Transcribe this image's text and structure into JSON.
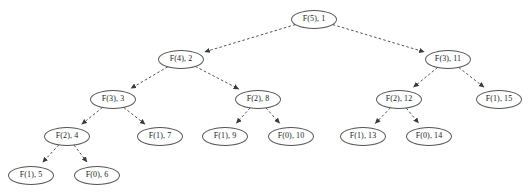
{
  "diagram": {
    "kind": "tree",
    "width": 529,
    "height": 195,
    "background_color": "#ffffff",
    "node_stroke_color": "#555555",
    "node_fill_color": "#ffffff",
    "edge_color": "#555555",
    "edge_style": "dashed",
    "arrowhead": "filled-triangle",
    "text_color": "#1a1a1a",
    "node_width": 46,
    "node_height": 19,
    "nodes": [
      {
        "id": "n1",
        "label": "F(5), 1",
        "cx": 314,
        "cy": 19,
        "level": 0,
        "call": "F(5)",
        "order": 1
      },
      {
        "id": "n2",
        "label": "F(4), 2",
        "cx": 181,
        "cy": 59,
        "level": 1,
        "call": "F(4)",
        "order": 2
      },
      {
        "id": "n11",
        "label": "F(3), 11",
        "cx": 448,
        "cy": 59,
        "level": 1,
        "call": "F(3)",
        "order": 11
      },
      {
        "id": "n3",
        "label": "F(3), 3",
        "cx": 113,
        "cy": 99,
        "level": 2,
        "call": "F(3)",
        "order": 3
      },
      {
        "id": "n8",
        "label": "F(2), 8",
        "cx": 258,
        "cy": 99,
        "level": 2,
        "call": "F(2)",
        "order": 8
      },
      {
        "id": "n12",
        "label": "F(2), 12",
        "cx": 399,
        "cy": 99,
        "level": 2,
        "call": "F(2)",
        "order": 12
      },
      {
        "id": "n15",
        "label": "F(1), 15",
        "cx": 499,
        "cy": 99,
        "level": 2,
        "call": "F(1)",
        "order": 15
      },
      {
        "id": "n4",
        "label": "F(2), 4",
        "cx": 67,
        "cy": 136,
        "level": 3,
        "call": "F(2)",
        "order": 4
      },
      {
        "id": "n7",
        "label": "F(1), 7",
        "cx": 160,
        "cy": 136,
        "level": 3,
        "call": "F(1)",
        "order": 7
      },
      {
        "id": "n9",
        "label": "F(1), 9",
        "cx": 225,
        "cy": 136,
        "level": 3,
        "call": "F(1)",
        "order": 9
      },
      {
        "id": "n10",
        "label": "F(0), 10",
        "cx": 291,
        "cy": 136,
        "level": 3,
        "call": "F(0)",
        "order": 10
      },
      {
        "id": "n13",
        "label": "F(1), 13",
        "cx": 363,
        "cy": 136,
        "level": 3,
        "call": "F(1)",
        "order": 13
      },
      {
        "id": "n14",
        "label": "F(0), 14",
        "cx": 429,
        "cy": 136,
        "level": 3,
        "call": "F(0)",
        "order": 14
      },
      {
        "id": "n5",
        "label": "F(1), 5",
        "cx": 31,
        "cy": 175,
        "level": 4,
        "call": "F(1)",
        "order": 5
      },
      {
        "id": "n6",
        "label": "F(0), 6",
        "cx": 97,
        "cy": 175,
        "level": 4,
        "call": "F(0)",
        "order": 6
      }
    ],
    "edges": [
      {
        "from": "n1",
        "to": "n2"
      },
      {
        "from": "n1",
        "to": "n11"
      },
      {
        "from": "n2",
        "to": "n3"
      },
      {
        "from": "n2",
        "to": "n8"
      },
      {
        "from": "n11",
        "to": "n12"
      },
      {
        "from": "n11",
        "to": "n15"
      },
      {
        "from": "n3",
        "to": "n4"
      },
      {
        "from": "n3",
        "to": "n7"
      },
      {
        "from": "n8",
        "to": "n9"
      },
      {
        "from": "n8",
        "to": "n10"
      },
      {
        "from": "n12",
        "to": "n13"
      },
      {
        "from": "n12",
        "to": "n14"
      },
      {
        "from": "n4",
        "to": "n5"
      },
      {
        "from": "n4",
        "to": "n6"
      }
    ]
  }
}
